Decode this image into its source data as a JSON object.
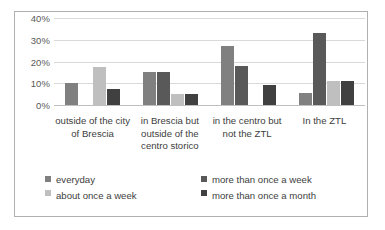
{
  "chart_data": {
    "type": "bar",
    "title": "",
    "xlabel": "",
    "ylabel": "",
    "ylim": [
      0,
      40
    ],
    "grid": true,
    "legend_position": "bottom",
    "ytick_labels": [
      "40%",
      "30%",
      "20%",
      "10%",
      "0%"
    ],
    "yticks": [
      40,
      30,
      20,
      10,
      0
    ],
    "categories": [
      "outside of the city of Brescia",
      "in Brescia but outside of the centro storico",
      "in the centro but not the ZTL",
      "In the ZTL"
    ],
    "series": [
      {
        "name": "everyday",
        "color": "#808080",
        "values": [
          10,
          15,
          27,
          5.5
        ]
      },
      {
        "name": "more than once a week",
        "color": "#595959",
        "values": [
          null,
          15,
          18,
          33
        ]
      },
      {
        "name": "about once a week",
        "color": "#bfbfbf",
        "values": [
          17.5,
          5,
          null,
          11
        ]
      },
      {
        "name": "more than once a month",
        "color": "#404040",
        "values": [
          7.5,
          5,
          9,
          11
        ]
      }
    ]
  },
  "legend": {
    "items": [
      "everyday",
      "more than once a week",
      "about once a week",
      "more than once a month"
    ]
  }
}
